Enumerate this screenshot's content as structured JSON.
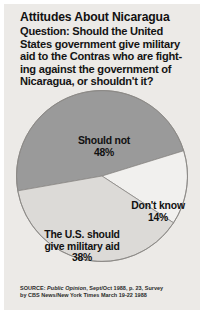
{
  "card": {
    "background_color": "#eceae7"
  },
  "header": {
    "title": "Attitudes About Nicaragua",
    "question_lines": [
      "Question: Should the United",
      "States government give military",
      "aid to the Contras who are fight-",
      "ing against the government of",
      "Nicaragua, or shouldn't it?"
    ]
  },
  "chart_data": {
    "type": "pie",
    "title": "Attitudes About Nicaragua",
    "subtitle": "Question: Should the United States government give military aid to the Contras who are fighting against the government of Nicaragua, or shouldn't it?",
    "categories": [
      "Should not",
      "Don't know",
      "The U.S. should give military aid"
    ],
    "values": [
      48,
      14,
      38
    ],
    "value_unit": "%",
    "slices": [
      {
        "label": "Should not",
        "value": 48,
        "value_label": "48%",
        "color": "#9a9a9a",
        "label_lines": [
          "Should not",
          "48%"
        ]
      },
      {
        "label": "Don't know",
        "value": 14,
        "value_label": "14%",
        "color": "#f1f0ee",
        "label_lines": [
          "Don't know",
          "14%"
        ]
      },
      {
        "label": "The U.S. should give military aid",
        "value": 38,
        "value_label": "38%",
        "color": "#dcdad7",
        "label_lines": [
          "The U.S. should",
          "give military aid",
          "38%"
        ]
      }
    ],
    "legend": "none",
    "grid": false,
    "start_angle_deg": 170,
    "direction": "clockwise",
    "stroke_color": "#8a8885"
  },
  "slice_labels": {
    "should_not": {
      "line1": "Should not",
      "line2": "48%"
    },
    "dont_know": {
      "line1": "Don't know",
      "line2": "14%"
    },
    "military_aid": {
      "line1": "The U.S. should",
      "line2": "give military aid",
      "line3": "38%"
    }
  },
  "source": {
    "prefix": "SOURCE: ",
    "publication": "Public Opinion",
    "line1_rest": ", Sept/Oct 1988, p. 23, Survey",
    "line2": "by CBS News/New York Times March 19-22 1988"
  }
}
